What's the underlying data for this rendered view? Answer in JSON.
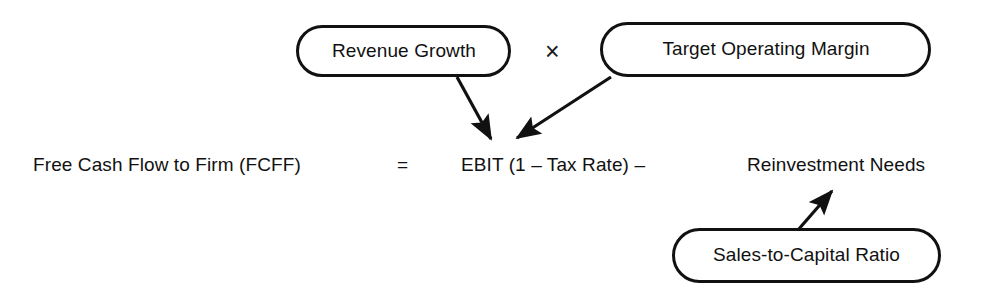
{
  "diagram": {
    "background_color": "#ffffff",
    "stroke_color": "#111111",
    "text_color": "#111111",
    "equation": {
      "left_side": "Free Cash Flow to Firm (FCFF)",
      "equals_sign": "=",
      "term_1": "EBIT (1 – Tax Rate) –",
      "term_2": "Reinvestment Needs"
    },
    "operators": {
      "multiply": "×"
    },
    "nodes": [
      {
        "id": "revenue-growth",
        "label": "Revenue Growth",
        "shape": "capsule"
      },
      {
        "id": "target-operating-margin",
        "label": "Target Operating Margin",
        "shape": "capsule"
      },
      {
        "id": "sales-to-capital-ratio",
        "label": "Sales-to-Capital Ratio",
        "shape": "capsule"
      }
    ],
    "connectors": [
      {
        "id": "revenue-growth-to-ebit",
        "from": "revenue-growth",
        "to": "term_1",
        "style": "solid-arrow"
      },
      {
        "id": "target-margin-to-ebit",
        "from": "target-operating-margin",
        "to": "term_1",
        "style": "solid-arrow"
      },
      {
        "id": "sales-capital-to-reinvestment",
        "from": "sales-to-capital-ratio",
        "to": "term_2",
        "style": "solid-arrow"
      }
    ]
  }
}
